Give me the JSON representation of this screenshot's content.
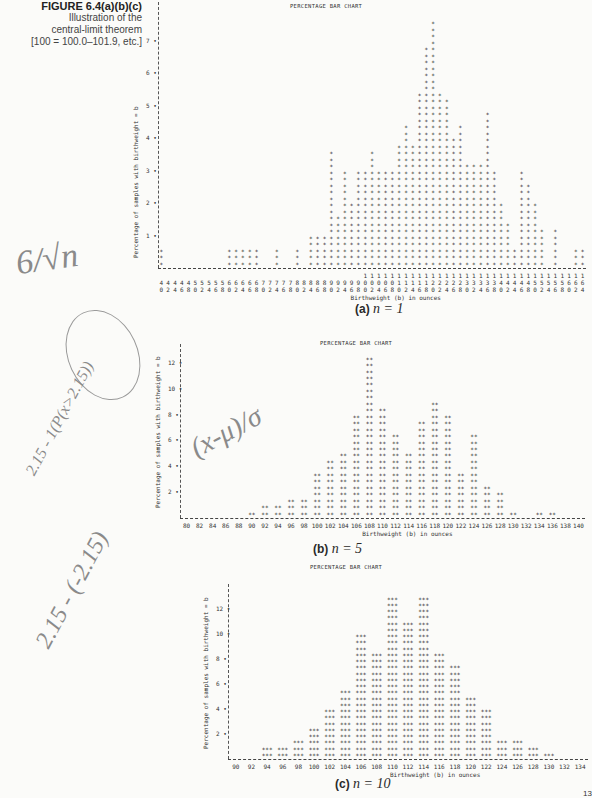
{
  "figure": {
    "label": "FIGURE 6.4(a)(b)(c)",
    "caption_lines": [
      "Illustration of the",
      "central-limit theorem",
      "[100 = 100.0–101.9, etc.]"
    ]
  },
  "handwritten_notes": {
    "note1": "6/√n",
    "note2": "2.15 - 1(P(x>2.15))",
    "note3": "(x-μ)/σ",
    "note4": "2.15 - (-2.15)"
  },
  "chart_data": [
    {
      "id": "a",
      "type": "bar",
      "title": "PERCENTAGE BAR CHART",
      "panel_label": "(a)",
      "panel_n": "n = 1",
      "xlabel": "Birthweight (b) in ounces",
      "ylabel": "Percentage of samples with birthweight = b",
      "symbol": "*",
      "yticks": [
        1,
        2,
        3,
        4,
        5,
        6,
        7
      ],
      "ylim": [
        0,
        8
      ],
      "grid": false,
      "categories": [
        40,
        42,
        44,
        46,
        48,
        50,
        52,
        54,
        56,
        58,
        60,
        62,
        64,
        66,
        68,
        70,
        72,
        74,
        76,
        78,
        80,
        82,
        84,
        86,
        88,
        90,
        92,
        94,
        96,
        98,
        100,
        102,
        104,
        106,
        108,
        110,
        112,
        114,
        116,
        118,
        120,
        122,
        124,
        126,
        128,
        130,
        132,
        134,
        136,
        138,
        140,
        142,
        144,
        146,
        148,
        150,
        152,
        154,
        156,
        158,
        160,
        162,
        164
      ],
      "values": [
        0.6,
        0,
        0,
        0,
        0,
        0,
        0,
        0,
        0,
        0,
        0.6,
        0.6,
        0.6,
        0.6,
        0.6,
        0,
        0,
        0.6,
        0,
        0,
        0.6,
        0,
        1.0,
        1.0,
        1.0,
        3.6,
        1.6,
        3.0,
        2.0,
        3.0,
        3.0,
        3.6,
        3.0,
        3.0,
        3.0,
        3.8,
        4.4,
        3.8,
        5.4,
        6.8,
        7.6,
        5.4,
        5.2,
        4.0,
        4.4,
        3.2,
        3.2,
        3.2,
        4.8,
        3.0,
        2.0,
        1.4,
        0.6,
        3.0,
        2.6,
        2.0,
        1.2,
        0,
        1.2,
        0,
        0,
        0.6,
        0.6,
        0.6,
        0,
        0.6
      ]
    },
    {
      "id": "b",
      "type": "bar",
      "title": "PERCENTAGE BAR CHART",
      "panel_label": "(b)",
      "panel_n": "n = 5",
      "xlabel": "Birthweight (b) in ounces",
      "ylabel": "Percentage of samples with birthweight = b",
      "symbol": "**",
      "yticks": [
        2,
        4,
        6,
        8,
        10,
        12
      ],
      "ylim": [
        0,
        13
      ],
      "grid": false,
      "categories": [
        80,
        82,
        84,
        86,
        88,
        90,
        92,
        94,
        96,
        98,
        100,
        102,
        104,
        106,
        108,
        110,
        112,
        114,
        116,
        118,
        120,
        122,
        124,
        126,
        128,
        130,
        132,
        134,
        136,
        138,
        140
      ],
      "values": [
        0,
        0,
        0,
        0,
        0,
        0.5,
        1.0,
        1.0,
        1.5,
        1.5,
        3.5,
        4.5,
        5.0,
        8.0,
        12.5,
        8.5,
        6.5,
        5.0,
        7.5,
        9.0,
        8.0,
        3.5,
        6.5,
        2.5,
        2.0,
        0.5,
        0,
        0.5,
        0.5,
        0,
        0
      ]
    },
    {
      "id": "c",
      "type": "bar",
      "title": "PERCENTAGE BAR CHART",
      "panel_label": "(c)",
      "panel_n": "n = 10",
      "xlabel": "Birthweight (b) in ounces",
      "ylabel": "Percentage of samples with birthweight = b",
      "symbol": "***",
      "yticks": [
        2,
        4,
        6,
        8,
        10,
        12
      ],
      "ylim": [
        0,
        13.5
      ],
      "grid": false,
      "categories": [
        90,
        92,
        94,
        96,
        98,
        100,
        102,
        104,
        106,
        108,
        110,
        112,
        114,
        116,
        118,
        120,
        122,
        124,
        126,
        128,
        130,
        132,
        134
      ],
      "values": [
        0,
        0,
        1.0,
        1.0,
        1.5,
        2.5,
        4.0,
        5.5,
        10.0,
        8.5,
        13.0,
        11.0,
        13.0,
        8.5,
        7.5,
        5.0,
        4.0,
        1.5,
        1.5,
        1.0,
        0.5,
        0,
        0
      ]
    }
  ],
  "page_number": "13"
}
